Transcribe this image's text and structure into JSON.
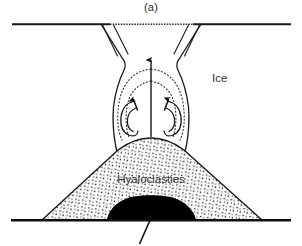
{
  "figure": {
    "caption": "(a)",
    "type": "cross-section diagram"
  },
  "labels": {
    "ice": "Ice",
    "hyaloclastites": "Hyaloclasties"
  },
  "colors": {
    "line": "#1a1a1a",
    "fill_lava": "#000000",
    "background": "#ffffff",
    "text": "#333333",
    "stipple": "#1a1a1a"
  },
  "geometry": {
    "ice_surface_line": {
      "x1": 12,
      "y1": 24,
      "x2": 291,
      "y2": 24
    },
    "ground_line": {
      "x1": 11,
      "y1": 220,
      "x2": 291,
      "y2": 220
    },
    "vent_center_x": 151,
    "mound_apex": {
      "x": 151,
      "y": 140
    },
    "mound_base_left_x": 42,
    "mound_base_right_x": 262,
    "lava_body": {
      "left_x": 107,
      "right_x": 196,
      "top_y": 196,
      "base_y": 220
    },
    "feeder_dike": {
      "x1": 151,
      "y1": 218,
      "x2": 141,
      "y2": 243
    },
    "central_arrow": {
      "x": 151,
      "y_tail": 137,
      "y_tip": 59
    }
  },
  "elements": {
    "ice_surface": "ice-surface",
    "crevasses_left": 2,
    "crevasses_right": 2,
    "convection_cells": 2,
    "streamlines": "dotted",
    "mound_texture": "stipple-dots"
  }
}
